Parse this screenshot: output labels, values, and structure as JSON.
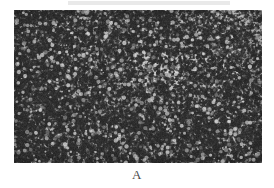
{
  "figure": {
    "panel_label": "A",
    "image_type": "histopathology-micrograph",
    "staining": "hematoxylin-eosin-grayscale",
    "background_color": "#ffffff"
  },
  "micrograph": {
    "alt_text": "grayscale photomicrograph of densely packed small round cells",
    "base_tone": "#b9b9b9",
    "nuclei_color": "#2e2e2e",
    "light_stroma_color": "#d8d8d8",
    "mid_tone_color": "#9a9a9a",
    "pale_patch_color": "#dcdcdc",
    "border_color": "#8f8f8f",
    "seed": 20250517,
    "regions": [
      {
        "name": "upper-right-pale-zone",
        "x_pct": 74,
        "y_pct": 16,
        "w_pct": 26,
        "h_pct": 34,
        "tone": "#d6d6d6"
      },
      {
        "name": "central-pale-stromal-band",
        "x_pct": 44,
        "y_pct": 28,
        "w_pct": 22,
        "h_pct": 22,
        "tone": "#d2d2d2"
      },
      {
        "name": "mid-right-vascular-clearing",
        "x_pct": 58,
        "y_pct": 34,
        "w_pct": 14,
        "h_pct": 14,
        "tone": "#dadada"
      },
      {
        "name": "left-dense-cellular-field",
        "x_pct": 2,
        "y_pct": 40,
        "w_pct": 30,
        "h_pct": 52,
        "tone": "#a6a6a6"
      },
      {
        "name": "lower-central-dense-field",
        "x_pct": 34,
        "y_pct": 62,
        "w_pct": 36,
        "h_pct": 34,
        "tone": "#a2a2a2"
      },
      {
        "name": "right-edge-pale-strip",
        "x_pct": 88,
        "y_pct": 44,
        "w_pct": 12,
        "h_pct": 26,
        "tone": "#cfcfcf"
      }
    ]
  },
  "top_band": {
    "name": "scan-artifact-band",
    "color": "#e9e9e9"
  }
}
